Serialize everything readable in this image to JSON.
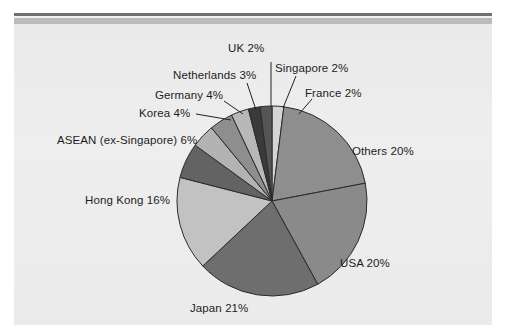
{
  "chart_data": {
    "type": "pie",
    "title": "",
    "subtitle": "",
    "xlabel": "",
    "ylabel": "",
    "legend_position": "none",
    "units": "percent",
    "grid": false,
    "start_angle_deg": 0,
    "direction": "clockwise",
    "categories": [
      "France",
      "Others",
      "USA",
      "Japan",
      "Hong Kong",
      "ASEAN (ex-Singapore)",
      "Korea",
      "Germany",
      "Netherlands",
      "UK",
      "Singapore"
    ],
    "values": [
      2,
      20,
      20,
      21,
      16,
      6,
      4,
      4,
      3,
      2,
      2
    ],
    "slices": [
      {
        "label": "France",
        "value": 2,
        "display": "France 2%",
        "color": "#d4d4d4"
      },
      {
        "label": "Others",
        "value": 20,
        "display": "Others 20%",
        "color": "#8e8e8e"
      },
      {
        "label": "USA",
        "value": 20,
        "display": "USA 20%",
        "color": "#8a8a8a"
      },
      {
        "label": "Japan",
        "value": 21,
        "display": "Japan 21%",
        "color": "#6e6e6e"
      },
      {
        "label": "Hong Kong",
        "value": 16,
        "display": "Hong Kong 16%",
        "color": "#c2c2c2"
      },
      {
        "label": "ASEAN (ex-Singapore)",
        "value": 6,
        "display": "ASEAN (ex-Singapore) 6%",
        "color": "#636363"
      },
      {
        "label": "Korea",
        "value": 4,
        "display": "Korea 4%",
        "color": "#b3b3b3"
      },
      {
        "label": "Germany",
        "value": 4,
        "display": "Germany 4%",
        "color": "#8e8e8e"
      },
      {
        "label": "Netherlands",
        "value": 3,
        "display": "Netherlands 3%",
        "color": "#b8b8b8"
      },
      {
        "label": "UK",
        "value": 2,
        "display": "UK 2%",
        "color": "#3a3a3a"
      },
      {
        "label": "Singapore",
        "value": 2,
        "display": "Singapore 2%",
        "color": "#555555"
      }
    ]
  },
  "labels": {
    "uk": "UK 2%",
    "singapore": "Singapore 2%",
    "netherlands": "Netherlands 3%",
    "france": "France 2%",
    "germany": "Germany 4%",
    "korea": "Korea 4%",
    "asean": "ASEAN (ex-Singapore) 6%",
    "others": "Others 20%",
    "hongkong": "Hong Kong 16%",
    "usa": "USA 20%",
    "japan": "Japan 21%"
  }
}
